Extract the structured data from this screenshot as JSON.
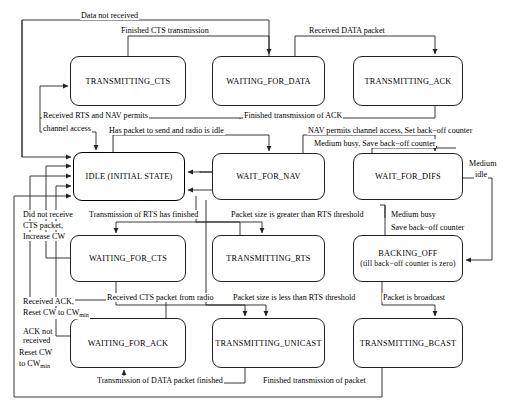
{
  "diagram": {
    "type": "state-diagram",
    "stroke_color": "#222222",
    "background": "#ffffff",
    "states": [
      {
        "id": "transmitting_cts",
        "label": "TRANSMITTING_CTS",
        "sub": "",
        "x": 70,
        "y": 56,
        "w": 116,
        "h": 50,
        "initial": false
      },
      {
        "id": "waiting_for_data",
        "label": "WAITING_FOR_DATA",
        "sub": "",
        "x": 212,
        "y": 56,
        "w": 113,
        "h": 50,
        "initial": false
      },
      {
        "id": "transmitting_ack",
        "label": "TRANSMITTING_ACK",
        "sub": "",
        "x": 353,
        "y": 56,
        "w": 110,
        "h": 50,
        "initial": false
      },
      {
        "id": "idle",
        "label": "IDLE (INITIAL STATE)",
        "sub": "",
        "x": 73,
        "y": 152,
        "w": 112,
        "h": 49,
        "initial": true
      },
      {
        "id": "wait_for_nav",
        "label": "WAIT_FOR_NAV",
        "sub": "",
        "x": 212,
        "y": 153,
        "w": 113,
        "h": 47,
        "initial": false
      },
      {
        "id": "wait_for_difs",
        "label": "WAIT_FOR_DIFS",
        "sub": "",
        "x": 353,
        "y": 153,
        "w": 110,
        "h": 47,
        "initial": false
      },
      {
        "id": "waiting_for_cts",
        "label": "WAITING_FOR_CTS",
        "sub": "",
        "x": 70,
        "y": 235,
        "w": 116,
        "h": 47,
        "initial": false
      },
      {
        "id": "transmitting_rts",
        "label": "TRANSMITTING_RTS",
        "sub": "",
        "x": 212,
        "y": 235,
        "w": 113,
        "h": 47,
        "initial": false
      },
      {
        "id": "backing_off",
        "label": "BACKING_OFF",
        "sub": "(till back−off counter is zero)",
        "x": 353,
        "y": 235,
        "w": 110,
        "h": 47,
        "initial": false
      },
      {
        "id": "waiting_for_ack",
        "label": "WAITING_FOR_ACK",
        "sub": "",
        "x": 70,
        "y": 318,
        "w": 116,
        "h": 50,
        "initial": false
      },
      {
        "id": "transmitting_unicast",
        "label": "TRANSMITTING_UNICAST",
        "sub": "",
        "x": 212,
        "y": 318,
        "w": 113,
        "h": 50,
        "initial": false
      },
      {
        "id": "transmitting_bcast",
        "label": "TRANSMITTING_BCAST",
        "sub": "",
        "x": 353,
        "y": 318,
        "w": 110,
        "h": 50,
        "initial": false
      }
    ],
    "transition_labels": [
      {
        "id": "data_not_received",
        "text": "Data not received",
        "x": 80,
        "y": 11,
        "align": "left"
      },
      {
        "id": "finished_cts_transmission",
        "text": "Finished CTS transmission",
        "x": 120,
        "y": 26,
        "align": "left"
      },
      {
        "id": "received_data_packet",
        "text": "Received DATA packet",
        "x": 308,
        "y": 26,
        "align": "left"
      },
      {
        "id": "received_rts_nav_1",
        "text": "Received RTS and NAV permits",
        "x": 42,
        "y": 111,
        "align": "left"
      },
      {
        "id": "received_rts_nav_2",
        "text": "channel access",
        "x": 42,
        "y": 124,
        "align": "left"
      },
      {
        "id": "finished_transmission_ack",
        "text": "Finished transmission of ACK",
        "x": 243,
        "y": 111,
        "align": "left"
      },
      {
        "id": "has_packet_to_send",
        "text": "Has packet to send and radio is idle",
        "x": 108,
        "y": 126,
        "align": "left"
      },
      {
        "id": "nav_permits_channel_access",
        "text": "NAV permits channel access, Set back−off counter",
        "x": 307,
        "y": 126,
        "align": "left"
      },
      {
        "id": "medium_busy_save_1",
        "text": "Medium busy, Save back−off counter",
        "x": 313,
        "y": 139,
        "align": "left"
      },
      {
        "id": "medium_idle_1",
        "text": "Medium",
        "x": 468,
        "y": 159,
        "align": "left"
      },
      {
        "id": "medium_idle_2",
        "text": "idle",
        "x": 474,
        "y": 170,
        "align": "left"
      },
      {
        "id": "did_not_receive_cts_1",
        "text": "Did not receive",
        "x": 22,
        "y": 210,
        "align": "left"
      },
      {
        "id": "did_not_receive_cts_2",
        "text": "CTS packet,",
        "x": 22,
        "y": 221,
        "align": "left"
      },
      {
        "id": "did_not_receive_cts_3",
        "text": "Increase CW",
        "x": 22,
        "y": 232,
        "align": "left"
      },
      {
        "id": "transmission_rts_finished",
        "text": "Transmission of RTS has finished",
        "x": 88,
        "y": 210,
        "align": "left"
      },
      {
        "id": "packet_greater_rts",
        "text": "Packet size is greater than RTS threshold",
        "x": 230,
        "y": 210,
        "align": "left"
      },
      {
        "id": "medium_busy_save_2a",
        "text": "Medium busy",
        "x": 390,
        "y": 210,
        "align": "left"
      },
      {
        "id": "medium_busy_save_2b",
        "text": "Save back−off counter",
        "x": 390,
        "y": 223,
        "align": "left"
      },
      {
        "id": "received_ack_reset_1",
        "text": "Received ACK,",
        "x": 22,
        "y": 297,
        "align": "left"
      },
      {
        "id": "received_cts_from_radio",
        "text": "Received CTS packet from radio",
        "x": 106,
        "y": 293,
        "align": "left"
      },
      {
        "id": "packet_less_rts",
        "text": "Packet size is less than RTS threshold",
        "x": 232,
        "y": 293,
        "align": "left"
      },
      {
        "id": "packet_is_broadcast",
        "text": "Packet is broadcast",
        "x": 382,
        "y": 293,
        "align": "left"
      },
      {
        "id": "ack_not_received_1",
        "text": "ACK not",
        "x": 22,
        "y": 327,
        "align": "left"
      },
      {
        "id": "ack_not_received_2",
        "text": "received",
        "x": 22,
        "y": 336,
        "align": "left"
      },
      {
        "id": "transmission_data_finished",
        "text": "Transmission of DATA packet finished",
        "x": 96,
        "y": 376,
        "align": "left"
      },
      {
        "id": "finished_transmission_pkt",
        "text": "Finished transmission of packet",
        "x": 262,
        "y": 376,
        "align": "left"
      }
    ],
    "subscript_labels": [
      {
        "id": "reset_cw_top",
        "pre": "Reset CW to CW",
        "sub": "min",
        "post": "",
        "x": 22,
        "y": 308
      },
      {
        "id": "reset_cw_left_1",
        "pre": "Reset CW",
        "sub": "",
        "post": "",
        "x": 18,
        "y": 348
      },
      {
        "id": "reset_cw_left_2",
        "pre": "to CW",
        "sub": "min",
        "post": "",
        "x": 18,
        "y": 359
      }
    ]
  }
}
